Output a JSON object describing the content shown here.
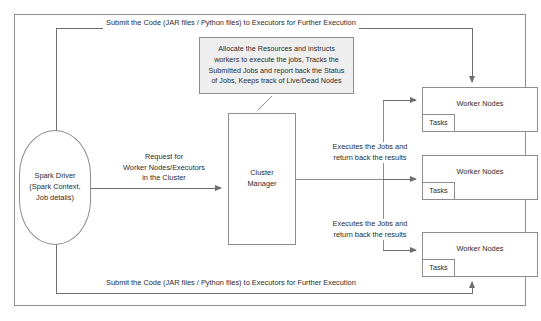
{
  "diagram": {
    "colors": {
      "stroke": "#8d8d8d",
      "text": "#2b2b2b",
      "callout_fill": "#eeeeee",
      "background": "#ffffff"
    },
    "nodes": {
      "driver": {
        "label": "Spark Driver\n(Spark Context,\nJob details)",
        "shape": "ellipse"
      },
      "cluster_manager": {
        "label": "Cluster\nManager",
        "shape": "rectangle"
      },
      "callout": {
        "label": "Allocate the Resources and instructs workers to execute the jobs, Tracks the Submitted Jobs and report back the Status of Jobs, Keeps track of Live/Dead Nodes",
        "shape": "note"
      },
      "workers": [
        {
          "label": "Worker Nodes",
          "tasks_label": "Tasks"
        },
        {
          "label": "Worker Nodes",
          "tasks_label": "Tasks"
        },
        {
          "label": "Worker Nodes",
          "tasks_label": "Tasks"
        }
      ]
    },
    "edges": {
      "submit_top": "Submit the Code (JAR files / Python files) to Executors for Further Execution",
      "submit_bottom": "Submit the Code (JAR files / Python files) to Executors for Further Execution",
      "request": "Request for\nWorker Nodes/Executors\nin the Cluster",
      "executes_1": "Executes the Jobs and\nreturn back the results",
      "executes_2": "Executes the Jobs and\nreturn back the results"
    }
  }
}
